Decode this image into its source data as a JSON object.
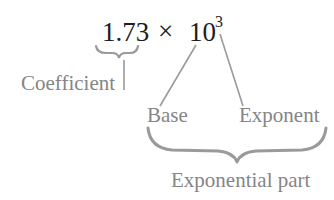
{
  "expression": {
    "coefficient": "1.73",
    "times": "×",
    "base": "10",
    "exponent": "3"
  },
  "labels": {
    "coefficient": "Coefficient",
    "base": "Base",
    "exponent": "Exponent",
    "exponential_part": "Exponential part"
  },
  "colors": {
    "expression_text": "#1e1e1e",
    "label_text": "#858585",
    "connector": "#9a9a9a",
    "background": "#ffffff"
  }
}
